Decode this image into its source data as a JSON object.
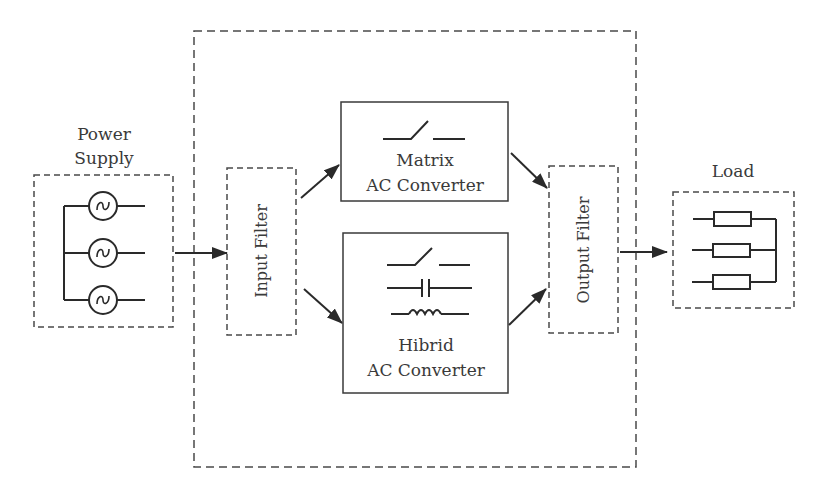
{
  "diagram": {
    "power_supply": {
      "label_line1": "Power",
      "label_line2": "Supply",
      "sources": 3,
      "source_symbol": "ac-voltage-source"
    },
    "input_filter": {
      "label": "Input Filter"
    },
    "matrix_converter": {
      "label_line1": "Matrix",
      "label_line2": "AC Converter",
      "symbols": [
        "switch"
      ]
    },
    "hybrid_converter": {
      "label_line1": "Hibrid",
      "label_line2": "AC Converter",
      "symbols": [
        "switch",
        "capacitor",
        "inductor"
      ]
    },
    "output_filter": {
      "label": "Output Filter"
    },
    "load": {
      "label": "Load",
      "resistors": 3
    },
    "connections": [
      {
        "from": "power_supply",
        "to": "input_filter"
      },
      {
        "from": "input_filter",
        "to": "matrix_converter"
      },
      {
        "from": "input_filter",
        "to": "hybrid_converter"
      },
      {
        "from": "matrix_converter",
        "to": "output_filter"
      },
      {
        "from": "hybrid_converter",
        "to": "output_filter"
      },
      {
        "from": "output_filter",
        "to": "load"
      }
    ],
    "colors": {
      "stroke": "#3a3a3a",
      "background": "#ffffff"
    }
  }
}
